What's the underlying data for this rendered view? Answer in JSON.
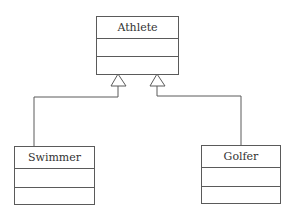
{
  "diagram": {
    "type": "uml-class-inheritance",
    "line_color": "#5a5a5a",
    "text_color": "#333333",
    "classes": [
      {
        "id": "athlete",
        "name": "Athlete",
        "attributes": [],
        "operations": []
      },
      {
        "id": "swimmer",
        "name": "Swimmer",
        "attributes": [],
        "operations": []
      },
      {
        "id": "golfer",
        "name": "Golfer",
        "attributes": [],
        "operations": []
      }
    ],
    "relationships": [
      {
        "type": "generalization",
        "from": "Swimmer",
        "to": "Athlete"
      },
      {
        "type": "generalization",
        "from": "Golfer",
        "to": "Athlete"
      }
    ]
  }
}
